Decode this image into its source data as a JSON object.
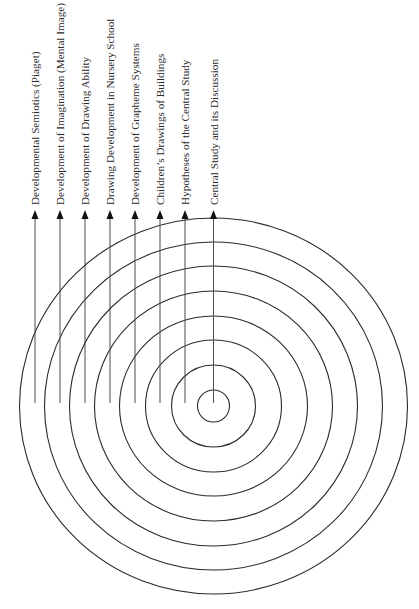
{
  "diagram": {
    "type": "concentric-rings",
    "center": {
      "x": 213.5,
      "y": 406
    },
    "labels": [
      {
        "text": "Developmental Semiotics (Piaget)",
        "x": 35
      },
      {
        "text": "Development of Imagination (Mental Image)",
        "x": 60
      },
      {
        "text": "Development of Drawing Ability",
        "x": 85
      },
      {
        "text": "Drawing Development in Nursery School",
        "x": 110
      },
      {
        "text": "Development of Grapheme Systems",
        "x": 135
      },
      {
        "text": "Children’s Drawings of Buildings",
        "x": 160
      },
      {
        "text": "Hypotheses of the Central Study",
        "x": 185
      },
      {
        "text": "Central Study and its Discussion",
        "x": 213.5
      }
    ],
    "rings": [
      {
        "rx": 194,
        "ry": 188
      },
      {
        "rx": 169,
        "ry": 164
      },
      {
        "rx": 144,
        "ry": 140
      },
      {
        "rx": 119,
        "ry": 115
      },
      {
        "rx": 94,
        "ry": 90
      },
      {
        "rx": 68,
        "ry": 66
      },
      {
        "rx": 42,
        "ry": 41
      },
      {
        "rx": 16,
        "ry": 16
      }
    ],
    "colors": {
      "line": "#2b2b2b",
      "text": "#2a2a2a",
      "background": "#ffffff"
    }
  }
}
